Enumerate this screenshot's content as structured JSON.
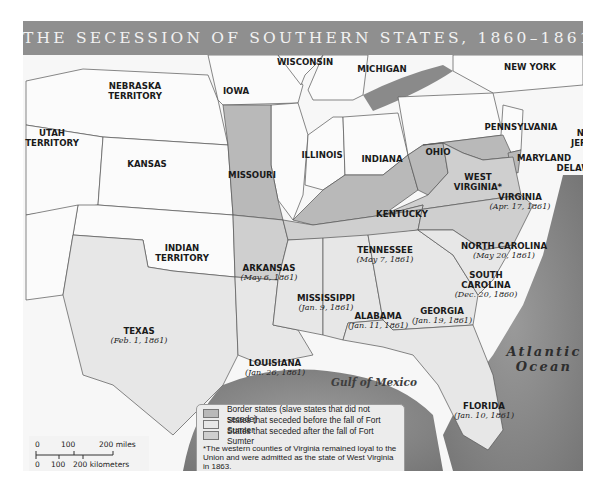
{
  "title": "THE SECESSION OF SOUTHERN STATES, 1860–1861",
  "colors": {
    "title_bar": "#8f8f8f",
    "border_state": "#b9b9b9",
    "seceded_before": "#e7e7e7",
    "seceded_after": "#cfcfcf",
    "union_state": "#fbfbfb",
    "water": "#8c8c8c"
  },
  "states": {
    "nebraska": {
      "name": "NEBRASKA TERRITORY",
      "line1": "NEBRASKA",
      "line2": "TERRITORY",
      "status": "territory"
    },
    "iowa": {
      "name": "IOWA",
      "status": "union"
    },
    "wisconsin": {
      "name": "WISCONSIN",
      "status": "union"
    },
    "michigan": {
      "name": "MICHIGAN",
      "status": "union"
    },
    "new_york": {
      "name": "NEW YORK",
      "status": "union"
    },
    "utah": {
      "name": "UTAH TERRITORY",
      "line1": "UTAH",
      "line2": "TERRITORY",
      "status": "territory"
    },
    "kansas": {
      "name": "KANSAS",
      "status": "union"
    },
    "missouri": {
      "name": "MISSOURI",
      "status": "border"
    },
    "illinois": {
      "name": "ILLINOIS",
      "status": "union"
    },
    "indiana": {
      "name": "INDIANA",
      "status": "union"
    },
    "ohio": {
      "name": "OHIO",
      "status": "union"
    },
    "pennsylvania": {
      "name": "PENNSYLVANIA",
      "status": "union"
    },
    "new_jersey": {
      "name": "NEW JERSEY",
      "line1": "NEW",
      "line2": "JERSEY",
      "status": "union"
    },
    "maryland": {
      "name": "MARYLAND",
      "status": "border"
    },
    "delaware": {
      "name": "DELAWARE",
      "status": "border"
    },
    "west_virginia": {
      "name": "WEST VIRGINIA*",
      "line1": "WEST",
      "line2": "VIRGINIA*",
      "status": "border"
    },
    "kentucky": {
      "name": "KENTUCKY",
      "status": "border"
    },
    "virginia": {
      "name": "VIRGINIA",
      "date": "(Apr. 17, 1861)",
      "status": "after"
    },
    "indian_territory": {
      "name": "INDIAN TERRITORY",
      "line1": "INDIAN",
      "line2": "TERRITORY",
      "status": "territory"
    },
    "arkansas": {
      "name": "ARKANSAS",
      "date": "(May 6, 1861)",
      "status": "after"
    },
    "tennessee": {
      "name": "TENNESSEE",
      "date": "(May 7, 1861)",
      "status": "after"
    },
    "north_carolina": {
      "name": "NORTH CAROLINA",
      "date": "(May 20, 1861)",
      "status": "after"
    },
    "south_carolina": {
      "name": "SOUTH CAROLINA",
      "line1": "SOUTH",
      "line2": "CAROLINA",
      "date": "(Dec. 20, 1860)",
      "status": "before"
    },
    "mississippi": {
      "name": "MISSISSIPPI",
      "date": "(Jan. 9, 1861)",
      "status": "before"
    },
    "alabama": {
      "name": "ALABAMA",
      "date": "(Jan. 11, 1861)",
      "status": "before"
    },
    "georgia": {
      "name": "GEORGIA",
      "date": "(Jan. 19, 1861)",
      "status": "before"
    },
    "texas": {
      "name": "TEXAS",
      "date": "(Feb. 1, 1861)",
      "status": "before"
    },
    "louisiana": {
      "name": "LOUISIANA",
      "date": "(Jan. 26, 1861)",
      "status": "before"
    },
    "florida": {
      "name": "FLORIDA",
      "date": "(Jan. 10, 1861)",
      "status": "before"
    }
  },
  "water": {
    "atlantic_line1": "Atlantic",
    "atlantic_line2": "Ocean",
    "gulf": "Gulf of Mexico"
  },
  "legend": {
    "items": [
      {
        "label": "Border states (slave states that did not secede)",
        "color": "#b9b9b9"
      },
      {
        "label": "States that seceded before the fall of Fort Sumter",
        "color": "#e7e7e7"
      },
      {
        "label": "States that seceded after the fall of Fort Sumter",
        "color": "#cfcfcf"
      }
    ],
    "footnote": "*The western counties of Virginia remained loyal to the Union and were admitted as the state of West Virginia in 1863."
  },
  "scale": {
    "miles_ticks": [
      "0",
      "100",
      "200 miles"
    ],
    "km_ticks": [
      "0",
      "100",
      "200 kilometers"
    ]
  }
}
